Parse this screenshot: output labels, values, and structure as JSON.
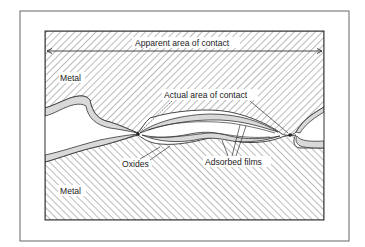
{
  "diagram": {
    "labels": {
      "apparent_area": "Apparent area of contact",
      "actual_area": "Actual area of contact",
      "metal_top": "Metal",
      "metal_bottom": "Metal",
      "oxides": "Oxides",
      "adsorbed_films": "Adsorbed films"
    },
    "colors": {
      "line": "#333333",
      "hatch": "#555555",
      "oxide_fill": "#d9d9d9",
      "gap_fill": "#ffffff",
      "background": "#ffffff"
    }
  }
}
